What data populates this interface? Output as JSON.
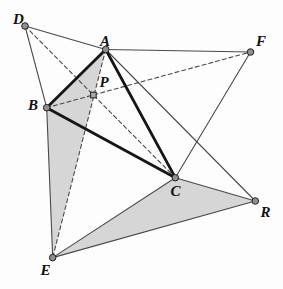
{
  "figure": {
    "background": "#fdfdfd",
    "colors": {
      "thin_line": "#4a4a4a",
      "thick_line": "#161616",
      "dashed_line": "#4a4a4a",
      "shade_fill": "#d6d6d6",
      "dot_fill": "#8f8f8f",
      "dot_stroke": "#222222",
      "marker_fill": "#ababab",
      "marker_stroke": "#2a2a2a",
      "label_color": "#111111"
    },
    "points": {
      "D": {
        "label": "D",
        "x": 25.0,
        "y": 26.0,
        "label_x": 18.5,
        "label_y": 19.0
      },
      "A": {
        "label": "A",
        "x": 105.7,
        "y": 49.5,
        "label_x": 105.0,
        "label_y": 40.5
      },
      "F": {
        "label": "F",
        "x": 250.5,
        "y": 52.0,
        "label_x": 261.0,
        "label_y": 41.0
      },
      "B": {
        "label": "B",
        "x": 46.7,
        "y": 107.7,
        "label_x": 33.0,
        "label_y": 104.5
      },
      "C": {
        "label": "C",
        "x": 175.3,
        "y": 177.7,
        "label_x": 175.5,
        "label_y": 191.0
      },
      "R": {
        "label": "R",
        "x": 255.3,
        "y": 201.0,
        "label_x": 265.5,
        "label_y": 211.5
      },
      "E": {
        "label": "E",
        "x": 52.7,
        "y": 257.6,
        "label_x": 45.5,
        "label_y": 269.5
      }
    },
    "center_marker": {
      "label": "P",
      "x": 93.4,
      "y": 95.0,
      "size": 5.6,
      "label_x": 104.0,
      "label_y": 82.0,
      "shape": "square"
    },
    "shaded_triangles": [
      {
        "name": "shade-ABE",
        "vertices": [
          "A",
          "B",
          "E"
        ]
      },
      {
        "name": "shade-CER",
        "vertices": [
          "C",
          "E",
          "R"
        ]
      }
    ],
    "edges": [
      {
        "from": "D",
        "to": "A",
        "style": "thin"
      },
      {
        "from": "D",
        "to": "B",
        "style": "thin"
      },
      {
        "from": "A",
        "to": "F",
        "style": "thin"
      },
      {
        "from": "F",
        "to": "C",
        "style": "thin"
      },
      {
        "from": "A",
        "to": "R",
        "style": "thin"
      },
      {
        "from": "B",
        "to": "E",
        "style": "thin"
      },
      {
        "from": "E",
        "to": "C",
        "style": "thin"
      },
      {
        "from": "E",
        "to": "R",
        "style": "thin"
      },
      {
        "from": "C",
        "to": "R",
        "style": "thin"
      },
      {
        "from": "D",
        "to": "C",
        "style": "dashed"
      },
      {
        "from": "B",
        "to": "F",
        "style": "dashed"
      },
      {
        "from": "A",
        "to": "E",
        "style": "dashed"
      },
      {
        "from": "A",
        "to": "B",
        "style": "thick"
      },
      {
        "from": "B",
        "to": "C",
        "style": "thick"
      },
      {
        "from": "C",
        "to": "A",
        "style": "thick"
      }
    ],
    "style": {
      "thin_width": 1.1,
      "thick_width": 2.8,
      "dash_pattern": "4 3",
      "dot_radius": 3.3
    }
  }
}
